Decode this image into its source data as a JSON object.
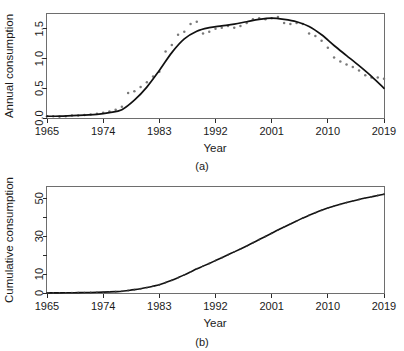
{
  "figure": {
    "caption_a": "(a)",
    "caption_b": "(b)"
  },
  "chart_data": [
    {
      "type": "scatter",
      "panel": "(a)",
      "title": "",
      "xlabel": "Year",
      "ylabel": "Annual consumption",
      "xlim": [
        1965,
        2019
      ],
      "ylim": [
        0.0,
        1.75
      ],
      "xticks": [
        1965,
        1974,
        1983,
        1992,
        2001,
        2010,
        2019
      ],
      "xtick_labels": [
        "1965",
        "1974",
        "1983",
        "1992",
        "2001",
        "2010",
        "2019"
      ],
      "yticks": [
        0.0,
        0.5,
        1.0,
        1.5
      ],
      "ytick_labels": [
        "0.0",
        "0.5",
        "1.0",
        "1.5"
      ],
      "grid": false,
      "legend": "none",
      "series": [
        {
          "name": "Observed annual consumption",
          "marker": "point",
          "color": "#7a7a7a",
          "x": [
            1965,
            1966,
            1967,
            1968,
            1969,
            1970,
            1971,
            1972,
            1973,
            1974,
            1975,
            1976,
            1977,
            1978,
            1979,
            1980,
            1981,
            1982,
            1983,
            1984,
            1985,
            1986,
            1987,
            1988,
            1989,
            1990,
            1991,
            1992,
            1993,
            1994,
            1995,
            1996,
            1997,
            1998,
            1999,
            2000,
            2001,
            2002,
            2003,
            2004,
            2005,
            2006,
            2007,
            2008,
            2009,
            2010,
            2011,
            2012,
            2013,
            2014,
            2015,
            2016,
            2017,
            2018,
            2019
          ],
          "y": [
            0.03,
            0.03,
            0.02,
            0.03,
            0.04,
            0.04,
            0.05,
            0.06,
            0.07,
            0.09,
            0.11,
            0.14,
            0.19,
            0.42,
            0.45,
            0.52,
            0.6,
            0.7,
            0.78,
            1.12,
            1.23,
            1.4,
            1.45,
            1.58,
            1.62,
            1.42,
            1.45,
            1.5,
            1.52,
            1.55,
            1.52,
            1.55,
            1.6,
            1.66,
            1.68,
            1.66,
            1.68,
            1.7,
            1.6,
            1.58,
            1.6,
            1.58,
            1.42,
            1.38,
            1.3,
            1.18,
            1.02,
            0.95,
            0.9,
            0.86,
            0.8,
            0.72,
            0.68,
            0.68,
            0.66
          ]
        },
        {
          "name": "Fitted trend",
          "marker": "line",
          "color": "#111111",
          "x": [
            1965,
            1967,
            1969,
            1971,
            1973,
            1975,
            1977,
            1979,
            1981,
            1983,
            1985,
            1987,
            1989,
            1991,
            1993,
            1995,
            1997,
            1999,
            2001,
            2003,
            2005,
            2007,
            2009,
            2011,
            2013,
            2015,
            2017,
            2019
          ],
          "y": [
            0.03,
            0.03,
            0.04,
            0.05,
            0.06,
            0.09,
            0.14,
            0.3,
            0.52,
            0.8,
            1.1,
            1.33,
            1.46,
            1.52,
            1.55,
            1.58,
            1.62,
            1.66,
            1.68,
            1.66,
            1.62,
            1.54,
            1.4,
            1.22,
            1.05,
            0.88,
            0.7,
            0.5
          ]
        }
      ]
    },
    {
      "type": "line",
      "panel": "(b)",
      "title": "",
      "xlabel": "Year",
      "ylabel": "Cumulative consumption",
      "xlim": [
        1965,
        2019
      ],
      "ylim": [
        0,
        56
      ],
      "xticks": [
        1965,
        1974,
        1983,
        1992,
        2001,
        2010,
        2019
      ],
      "xtick_labels": [
        "1965",
        "1974",
        "1983",
        "1992",
        "2001",
        "2010",
        "2019"
      ],
      "yticks": [
        0,
        10,
        20,
        30,
        40,
        50
      ],
      "ytick_labels": [
        "0",
        "10",
        "",
        "30",
        "",
        "50"
      ],
      "grid": false,
      "legend": "none",
      "series": [
        {
          "name": "Cumulative consumption",
          "marker": "line-with-points",
          "color": "#111111",
          "x": [
            1965,
            1966,
            1967,
            1968,
            1969,
            1970,
            1971,
            1972,
            1973,
            1974,
            1975,
            1976,
            1977,
            1978,
            1979,
            1980,
            1981,
            1982,
            1983,
            1984,
            1985,
            1986,
            1987,
            1988,
            1989,
            1990,
            1991,
            1992,
            1993,
            1994,
            1995,
            1996,
            1997,
            1998,
            1999,
            2000,
            2001,
            2002,
            2003,
            2004,
            2005,
            2006,
            2007,
            2008,
            2009,
            2010,
            2011,
            2012,
            2013,
            2014,
            2015,
            2016,
            2017,
            2018,
            2019
          ],
          "y": [
            0.03,
            0.06,
            0.08,
            0.11,
            0.15,
            0.19,
            0.24,
            0.3,
            0.37,
            0.46,
            0.57,
            0.71,
            0.9,
            1.32,
            1.77,
            2.29,
            2.89,
            3.59,
            4.37,
            5.49,
            6.72,
            8.12,
            9.57,
            11.15,
            12.77,
            14.19,
            15.64,
            17.14,
            18.66,
            20.21,
            21.73,
            23.28,
            24.88,
            26.54,
            28.22,
            29.88,
            31.56,
            33.26,
            34.86,
            36.44,
            38.04,
            39.62,
            41.04,
            42.42,
            43.72,
            44.9,
            45.92,
            46.87,
            47.77,
            48.63,
            49.43,
            50.15,
            50.83,
            51.51,
            52.17
          ]
        }
      ]
    }
  ]
}
